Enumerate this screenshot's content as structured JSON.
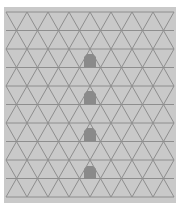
{
  "colors": {
    "page_bg": "#ffffff",
    "grid_bg": "#c9c9c9",
    "grid_line": "#8e8e8e",
    "marker_fill": "#8a8a8a"
  },
  "grid": {
    "type": "triangular",
    "rows": 10,
    "row_height": 18.5,
    "triangle_width": 21,
    "origin_x": 6,
    "origin_y": 12,
    "width": 168
  },
  "markers": [
    {
      "x": 84,
      "y": 54,
      "w": 12,
      "h": 13
    },
    {
      "x": 84,
      "y": 91,
      "w": 12,
      "h": 13
    },
    {
      "x": 84,
      "y": 128,
      "w": 12,
      "h": 13
    },
    {
      "x": 84,
      "y": 166,
      "w": 12,
      "h": 13
    }
  ]
}
